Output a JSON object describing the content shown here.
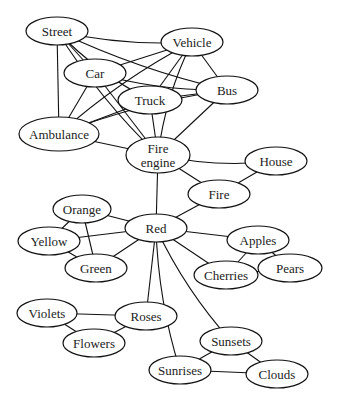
{
  "diagram": {
    "type": "semantic-network",
    "nodes": [
      {
        "id": "street",
        "label": "Street",
        "x": 57,
        "y": 31,
        "rx": 31,
        "ry": 14
      },
      {
        "id": "vehicle",
        "label": "Vehicle",
        "x": 192,
        "y": 42,
        "rx": 31,
        "ry": 14
      },
      {
        "id": "car",
        "label": "Car",
        "x": 95,
        "y": 73,
        "rx": 31,
        "ry": 14
      },
      {
        "id": "bus",
        "label": "Bus",
        "x": 227,
        "y": 90,
        "rx": 31,
        "ry": 14
      },
      {
        "id": "truck",
        "label": "Truck",
        "x": 150,
        "y": 100,
        "rx": 32,
        "ry": 14
      },
      {
        "id": "ambulance",
        "label": "Ambulance",
        "x": 59,
        "y": 134,
        "rx": 40,
        "ry": 17
      },
      {
        "id": "fire_engine",
        "label": "Fire engine",
        "lines": [
          "Fire",
          "engine"
        ],
        "x": 158,
        "y": 155,
        "rx": 32,
        "ry": 18
      },
      {
        "id": "house",
        "label": "House",
        "x": 276,
        "y": 161,
        "rx": 31,
        "ry": 14
      },
      {
        "id": "fire",
        "label": "Fire",
        "x": 219,
        "y": 194,
        "rx": 31,
        "ry": 14
      },
      {
        "id": "orange",
        "label": "Orange",
        "x": 82,
        "y": 209,
        "rx": 29,
        "ry": 14
      },
      {
        "id": "red",
        "label": "Red",
        "x": 156,
        "y": 228,
        "rx": 31,
        "ry": 14
      },
      {
        "id": "yellow",
        "label": "Yellow",
        "x": 49,
        "y": 241,
        "rx": 31,
        "ry": 14
      },
      {
        "id": "apples",
        "label": "Apples",
        "x": 258,
        "y": 240,
        "rx": 31,
        "ry": 14
      },
      {
        "id": "green",
        "label": "Green",
        "x": 96,
        "y": 268,
        "rx": 31,
        "ry": 14
      },
      {
        "id": "cherries",
        "label": "Cherries",
        "x": 226,
        "y": 275,
        "rx": 32,
        "ry": 14
      },
      {
        "id": "pears",
        "label": "Pears",
        "x": 290,
        "y": 268,
        "rx": 32,
        "ry": 14
      },
      {
        "id": "violets",
        "label": "Violets",
        "x": 47,
        "y": 313,
        "rx": 30,
        "ry": 14
      },
      {
        "id": "roses",
        "label": "Roses",
        "x": 146,
        "y": 316,
        "rx": 31,
        "ry": 14
      },
      {
        "id": "flowers",
        "label": "Flowers",
        "x": 94,
        "y": 343,
        "rx": 31,
        "ry": 14
      },
      {
        "id": "sunsets",
        "label": "Sunsets",
        "x": 231,
        "y": 341,
        "rx": 31,
        "ry": 14
      },
      {
        "id": "sunrises",
        "label": "Sunrises",
        "x": 180,
        "y": 370,
        "rx": 31,
        "ry": 14
      },
      {
        "id": "clouds",
        "label": "Clouds",
        "x": 277,
        "y": 374,
        "rx": 31,
        "ry": 14
      }
    ],
    "edges": [
      [
        "street",
        "vehicle"
      ],
      [
        "street",
        "car"
      ],
      [
        "street",
        "truck"
      ],
      [
        "street",
        "bus"
      ],
      [
        "street",
        "ambulance"
      ],
      [
        "street",
        "fire_engine"
      ],
      [
        "vehicle",
        "car"
      ],
      [
        "vehicle",
        "truck"
      ],
      [
        "vehicle",
        "bus"
      ],
      [
        "vehicle",
        "ambulance"
      ],
      [
        "vehicle",
        "fire_engine"
      ],
      [
        "car",
        "bus"
      ],
      [
        "car",
        "ambulance"
      ],
      [
        "car",
        "fire_engine"
      ],
      [
        "truck",
        "bus"
      ],
      [
        "truck",
        "ambulance"
      ],
      [
        "truck",
        "fire_engine"
      ],
      [
        "bus",
        "ambulance"
      ],
      [
        "bus",
        "fire_engine"
      ],
      [
        "ambulance",
        "fire_engine"
      ],
      [
        "fire_engine",
        "house"
      ],
      [
        "fire_engine",
        "fire"
      ],
      [
        "fire_engine",
        "red"
      ],
      [
        "house",
        "fire"
      ],
      [
        "fire",
        "red"
      ],
      [
        "red",
        "orange"
      ],
      [
        "red",
        "yellow"
      ],
      [
        "red",
        "green"
      ],
      [
        "red",
        "apples"
      ],
      [
        "red",
        "cherries"
      ],
      [
        "red",
        "roses"
      ],
      [
        "red",
        "sunsets"
      ],
      [
        "red",
        "sunrises"
      ],
      [
        "orange",
        "yellow"
      ],
      [
        "orange",
        "green"
      ],
      [
        "yellow",
        "green"
      ],
      [
        "apples",
        "cherries"
      ],
      [
        "apples",
        "pears"
      ],
      [
        "cherries",
        "pears"
      ],
      [
        "violets",
        "roses"
      ],
      [
        "violets",
        "flowers"
      ],
      [
        "roses",
        "flowers"
      ],
      [
        "sunsets",
        "sunrises"
      ],
      [
        "sunsets",
        "clouds"
      ],
      [
        "sunrises",
        "clouds"
      ]
    ]
  }
}
